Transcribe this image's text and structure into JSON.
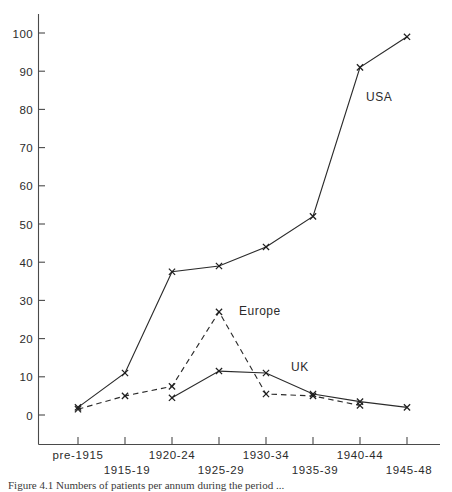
{
  "chart_data": {
    "type": "line",
    "title": "",
    "subtitle": "",
    "xlabel": "",
    "ylabel": "",
    "grid": false,
    "legend_position": "inline-annotations",
    "categories": [
      "pre-1915",
      "1915-19",
      "1920-24",
      "1925-29",
      "1930-34",
      "1935-39",
      "1940-44",
      "1945-48"
    ],
    "ylim": [
      0,
      100
    ],
    "yticks": [
      0,
      10,
      20,
      30,
      40,
      50,
      60,
      70,
      80,
      90,
      100
    ],
    "ytick_labels": [
      "0",
      "10",
      "20",
      "30",
      "40",
      "50",
      "60",
      "70",
      "80",
      "90",
      "100"
    ],
    "series": [
      {
        "name": "USA",
        "style": "solid",
        "marker": "x",
        "values": [
          2,
          11,
          37.5,
          39,
          44,
          52,
          91,
          99
        ]
      },
      {
        "name": "Europe",
        "style": "dashed",
        "marker": "x",
        "values": [
          1.5,
          5,
          7.5,
          27,
          5.5,
          5,
          2.5,
          null
        ]
      },
      {
        "name": "UK",
        "style": "solid",
        "marker": "x",
        "values": [
          null,
          null,
          4.5,
          11.5,
          11,
          5.5,
          3.5,
          2
        ]
      }
    ],
    "annotations": [
      {
        "text": "USA",
        "x_px": 366,
        "y_px": 101
      },
      {
        "text": "Europe",
        "x_px": 239,
        "y_px": 315
      },
      {
        "text": "UK",
        "x_px": 291,
        "y_px": 371
      }
    ]
  },
  "axes": {
    "y_tick_labels": [
      "100",
      "90",
      "80",
      "70",
      "60",
      "50",
      "40",
      "30",
      "20",
      "10",
      "0"
    ],
    "x_tick_labels_top_row": [
      "pre-1915",
      "1920-24",
      "1930-34",
      "1940-44"
    ],
    "x_tick_labels_bottom_row": [
      "1915-19",
      "1925-29",
      "1935-39",
      "1945-48"
    ]
  },
  "series_labels": {
    "usa": "USA",
    "europe": "Europe",
    "uk": "UK"
  },
  "caption": {
    "text": "Figure 4.1  Numbers of patients per annum during the period ..."
  }
}
